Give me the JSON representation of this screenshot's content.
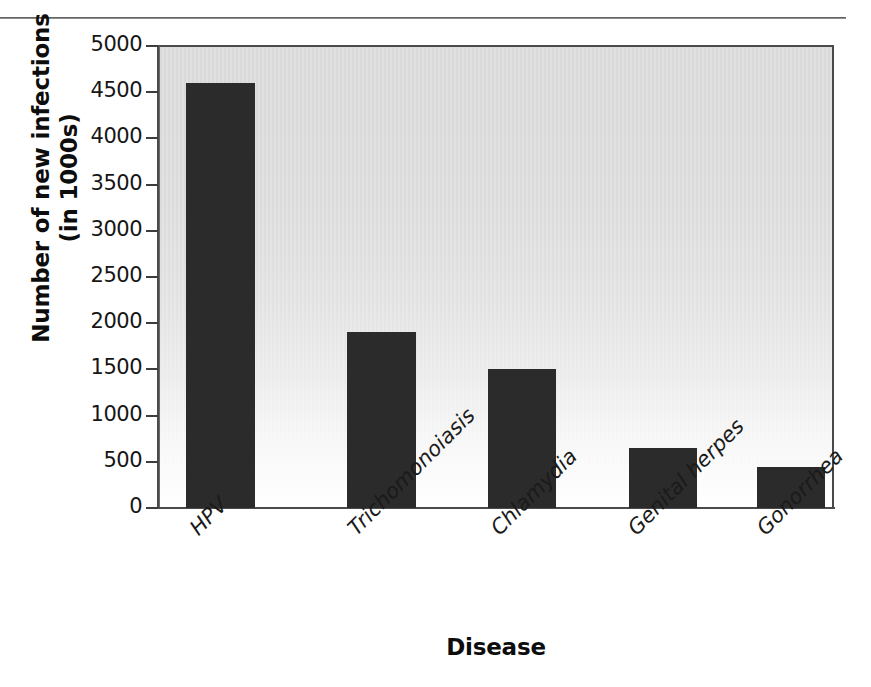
{
  "figure": {
    "background_color": "#ffffff",
    "plot_background_top": "#d9d9d9",
    "plot_background_bottom": "#ffffff",
    "bar_color": "#2b2b2b",
    "axis_color": "#4a4a4a",
    "top_rule_color": "#5b5b5b"
  },
  "chart_data": {
    "type": "bar",
    "title": "",
    "xlabel": "Disease",
    "ylabel": "Number of new infections (in 1000s)",
    "ylabel_line1": "Number of new infections",
    "ylabel_line2": "(in 1000s)",
    "categories": [
      "HPV",
      "Trichomonoiasis",
      "Chlamydia",
      "Genital herpes",
      "Gonorrhea"
    ],
    "values": [
      4600,
      1900,
      1500,
      650,
      440
    ],
    "ylim": [
      0,
      5000
    ],
    "yticks": [
      0,
      500,
      1000,
      1500,
      2000,
      2500,
      3000,
      3500,
      4000,
      4500,
      5000
    ],
    "ytick_labels": [
      "0",
      "500",
      "1000",
      "1500",
      "2000",
      "2500",
      "3000",
      "3500",
      "4000",
      "4500",
      "5000"
    ],
    "grid": false,
    "legend": null,
    "legend_position": "none",
    "units": "thousands of new infections",
    "bar_geometry": [
      {
        "category": "HPV",
        "left_px": 186,
        "width_px": 69,
        "value": 4600
      },
      {
        "category": "Trichomonoiasis",
        "left_px": 347,
        "width_px": 69,
        "value": 1900
      },
      {
        "category": "Chlamydia",
        "left_px": 488,
        "width_px": 68,
        "value": 1500
      },
      {
        "category": "Genital herpes",
        "left_px": 629,
        "width_px": 68,
        "value": 650
      },
      {
        "category": "Gonorrhea",
        "left_px": 757,
        "width_px": 68,
        "value": 440
      }
    ],
    "category_label_anchor_px": [
      185,
      343,
      486,
      623,
      752
    ]
  }
}
